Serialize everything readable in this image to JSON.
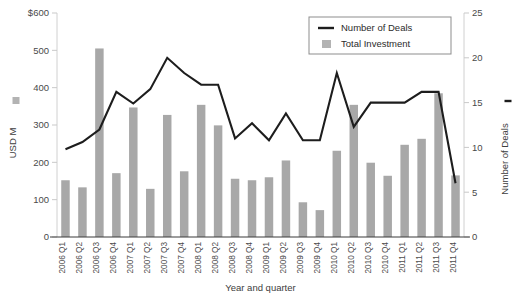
{
  "chart_data": {
    "type": "bar",
    "title": "",
    "xlabel": "Year and quarter",
    "ylabel": "USD M",
    "y2label": "Number of Deals",
    "grid": false,
    "legend_position": "top-right",
    "categories": [
      "2006 Q1",
      "2006 Q2",
      "2006 Q3",
      "2006 Q4",
      "2007 Q1",
      "2007 Q2",
      "2007 Q3",
      "2007 Q4",
      "2008 Q1",
      "2008 Q2",
      "2008 Q3",
      "2008 Q4",
      "2009 Q1",
      "2009 Q2",
      "2009 Q3",
      "2009 Q4",
      "2010 Q1",
      "2010 Q2",
      "2010 Q3",
      "2010 Q4",
      "2011 Q1",
      "2011 Q2",
      "2011 Q3",
      "2011 Q4"
    ],
    "ylim": [
      0,
      600
    ],
    "yticks": [
      0,
      100,
      200,
      300,
      400,
      500,
      600
    ],
    "ytick_labels": [
      "0",
      "100",
      "200",
      "300",
      "400",
      "500",
      "$600"
    ],
    "y2lim": [
      0,
      25
    ],
    "y2ticks": [
      0,
      5,
      10,
      15,
      20,
      25
    ],
    "y2tick_labels": [
      "0",
      "5",
      "10",
      "15",
      "20",
      "25"
    ],
    "series": [
      {
        "name": "Total Investment",
        "kind": "bar",
        "axis": "left",
        "unit": "USD M",
        "color": "#a8a8a8",
        "values": [
          152,
          133,
          505,
          171,
          347,
          129,
          327,
          176,
          354,
          299,
          156,
          152,
          160,
          205,
          93,
          72,
          231,
          354,
          199,
          164,
          247,
          263,
          385,
          165
        ]
      },
      {
        "name": "Number of Deals",
        "kind": "line",
        "axis": "right",
        "unit": "deals",
        "color": "#1d1d1d",
        "values": [
          9.8,
          10.6,
          12.0,
          16.2,
          14.9,
          16.5,
          20.0,
          18.3,
          17.0,
          17.0,
          11.0,
          12.7,
          10.8,
          13.8,
          10.8,
          10.8,
          18.3,
          12.3,
          15.0,
          15.0,
          15.0,
          16.2,
          16.2,
          6.0
        ]
      }
    ]
  },
  "axes": {
    "left_title": "USD M",
    "right_title": "Number of Deals",
    "bottom_title": "Year and quarter"
  },
  "legend": {
    "items": [
      {
        "label": "Number of Deals",
        "marker": "line"
      },
      {
        "label": "Total Investment",
        "marker": "bar"
      }
    ]
  }
}
